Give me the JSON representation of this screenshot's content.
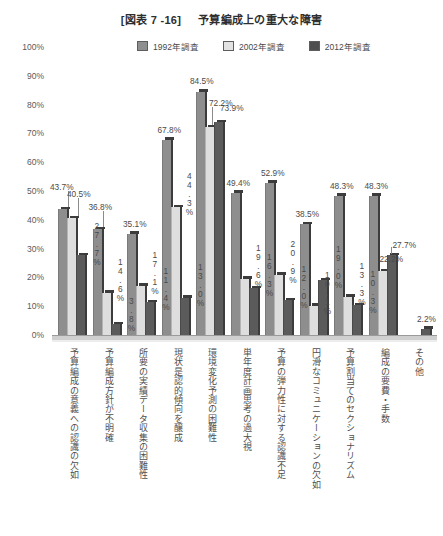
{
  "title": {
    "code": "[図表 7 -16]",
    "text": "予算編成上の重大な障害"
  },
  "legend": {
    "position": "top-center",
    "items": [
      {
        "label": "1992年調査",
        "color": "#8e8e8e",
        "icon": "legend-swatch"
      },
      {
        "label": "2002年調査",
        "color": "#dedede",
        "icon": "legend-swatch"
      },
      {
        "label": "2012年調査",
        "color": "#5b5b5b",
        "icon": "legend-swatch"
      }
    ]
  },
  "chart_data": {
    "type": "bar",
    "title": "予算編成上の重大な障害",
    "xlabel": "",
    "ylabel": "",
    "ylim": [
      0,
      100
    ],
    "yunit": "%",
    "grid": false,
    "legend_position": "top-center",
    "yticks": [
      "0%",
      "10%",
      "20%",
      "30%",
      "40%",
      "50%",
      "60%",
      "70%",
      "80%",
      "90%",
      "100%"
    ],
    "categories": [
      "予算編成の意義への認識の欠如",
      "予算編成方針が不明確",
      "所要の実績データ収集の困難性",
      "現状是認的傾向を醸成",
      "環境変化予測の困難性",
      "単年度計画思考の過大視",
      "予算の弾力性に対する認識不足",
      "円滑なコミュニケーションの欠如",
      "予算割当てのセクショナリズム",
      "編成の要費・手数",
      "その他"
    ],
    "series": [
      {
        "name": "1992年調査",
        "color": "#8e8e8e",
        "values": [
          43.7,
          36.8,
          35.1,
          67.8,
          84.5,
          49.4,
          52.9,
          38.5,
          48.3,
          48.3,
          null
        ],
        "labels": [
          "43.7%",
          "36.8%",
          "35.1%",
          "67.8%",
          "84.5%",
          "49.4%",
          "52.9%",
          "38.5%",
          "48.3%",
          "48.3%",
          ""
        ]
      },
      {
        "name": "2002年調査",
        "color": "#dedede",
        "values": [
          40.5,
          14.6,
          17.1,
          44.3,
          72.2,
          19.6,
          20.9,
          10.1,
          13.3,
          22.2,
          null
        ],
        "labels": [
          "40.5%",
          "14.6%",
          "17.1%",
          "44.3%",
          "72.2%",
          "19.6%",
          "20.9%",
          "10.1%",
          "13.3%",
          "22.2%",
          ""
        ]
      },
      {
        "name": "2012年調査",
        "color": "#5b5b5b",
        "values": [
          27.7,
          3.8,
          11.4,
          13.0,
          73.9,
          16.3,
          12.0,
          19.0,
          10.3,
          27.7,
          2.2
        ],
        "labels": [
          "27.7%",
          "3.8%",
          "11.4%",
          "13.0%",
          "73.9%",
          "16.3%",
          "12.0%",
          "19.0%",
          "10.3%",
          "27.7%",
          "2.2%"
        ]
      }
    ]
  }
}
